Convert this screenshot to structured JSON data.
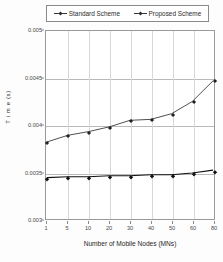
{
  "chart_data": {
    "type": "line",
    "title": "",
    "xlabel": "Number of Mobile Nodes (MNs)",
    "ylabel": "T i m e (s)",
    "categories": [
      "1",
      "5",
      "10",
      "20",
      "30",
      "40",
      "50",
      "60",
      "80"
    ],
    "yticks": [
      "0.005",
      "0.0045",
      "0.004",
      "0.0035",
      "0.003"
    ],
    "ytick_values": [
      0.005,
      0.0045,
      0.004,
      0.0035,
      0.003
    ],
    "ylim": [
      0.003,
      0.005
    ],
    "grid": true,
    "legend_position": "top",
    "series": [
      {
        "name": "Standard Scheme",
        "values": [
          0.00382,
          0.00389,
          0.00393,
          0.00398,
          0.00405,
          0.00406,
          0.00412,
          0.00425,
          0.00447
        ]
      },
      {
        "name": "Proposed Scheme",
        "values": [
          0.00344,
          0.00345,
          0.00345,
          0.00346,
          0.00346,
          0.00347,
          0.00347,
          0.00349,
          0.00352
        ]
      }
    ]
  },
  "legend": {
    "entries": [
      {
        "label": "Standard Scheme"
      },
      {
        "label": "Proposed Scheme"
      }
    ]
  },
  "colors": {
    "series_standard": "#3a3a3a",
    "series_proposed": "#111111",
    "grid": "#b9b9b9",
    "frame": "#9a9a9a"
  }
}
